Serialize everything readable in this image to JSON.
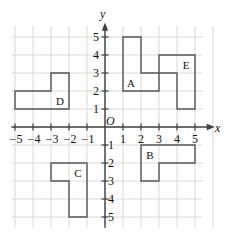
{
  "figure": {
    "type": "coordinate-plane-shapes",
    "background_color": "#ffffff",
    "grid_color": "#d9d9d9",
    "axis_color": "#404040",
    "shape_stroke_color": "#555555",
    "text_color": "#111111"
  },
  "geometry": {
    "origin_px": {
      "x": 105,
      "y": 127
    },
    "unit_px": 18,
    "grid_x_range": [
      -5.2,
      6.0
    ],
    "grid_y_range": [
      -5.6,
      5.6
    ]
  },
  "axes": {
    "x_axis": {
      "label": "x",
      "label_pos": {
        "x": 215,
        "y": 122
      },
      "ticks": [
        {
          "value": -5,
          "label": "−5"
        },
        {
          "value": -4,
          "label": "−4"
        },
        {
          "value": -3,
          "label": "−3"
        },
        {
          "value": -2,
          "label": "−2"
        },
        {
          "value": -1,
          "label": "−1"
        },
        {
          "value": 1,
          "label": "1"
        },
        {
          "value": 2,
          "label": "2"
        },
        {
          "value": 3,
          "label": "3"
        },
        {
          "value": 4,
          "label": "4"
        },
        {
          "value": 5,
          "label": "5"
        }
      ]
    },
    "y_axis": {
      "label": "y",
      "label_pos": {
        "x": 100,
        "y": 8
      },
      "ticks": [
        {
          "value": 5,
          "label": "5"
        },
        {
          "value": 4,
          "label": "4"
        },
        {
          "value": 3,
          "label": "3"
        },
        {
          "value": 2,
          "label": "2"
        },
        {
          "value": 1,
          "label": "1"
        },
        {
          "value": -1,
          "label": "−1"
        },
        {
          "value": -2,
          "label": "−2"
        },
        {
          "value": -3,
          "label": "−3"
        },
        {
          "value": -4,
          "label": "−4"
        },
        {
          "value": -5,
          "label": "−5"
        }
      ]
    },
    "origin": {
      "label": "O"
    }
  },
  "shapes": [
    {
      "id": "A",
      "label": "A",
      "label_point": {
        "x": 1.45,
        "y": 2.45
      },
      "points": [
        [
          1,
          2
        ],
        [
          1,
          5
        ],
        [
          2,
          5
        ],
        [
          2,
          3
        ],
        [
          3,
          3
        ],
        [
          3,
          2
        ]
      ]
    },
    {
      "id": "B",
      "label": "B",
      "label_point": {
        "x": 2.5,
        "y": -1.55
      },
      "points": [
        [
          2,
          -1
        ],
        [
          5,
          -1
        ],
        [
          5,
          -2
        ],
        [
          3,
          -2
        ],
        [
          3,
          -3
        ],
        [
          2,
          -3
        ]
      ]
    },
    {
      "id": "C",
      "label": "C",
      "label_point": {
        "x": -1.5,
        "y": -2.55
      },
      "points": [
        [
          -3,
          -2
        ],
        [
          -1,
          -2
        ],
        [
          -1,
          -5
        ],
        [
          -2,
          -5
        ],
        [
          -2,
          -3
        ],
        [
          -3,
          -3
        ]
      ]
    },
    {
      "id": "D",
      "label": "D",
      "label_point": {
        "x": -2.5,
        "y": 1.45
      },
      "points": [
        [
          -5,
          1
        ],
        [
          -2,
          1
        ],
        [
          -2,
          3
        ],
        [
          -3,
          3
        ],
        [
          -3,
          2
        ],
        [
          -5,
          2
        ]
      ]
    },
    {
      "id": "E",
      "label": "E",
      "label_point": {
        "x": 4.5,
        "y": 3.45
      },
      "points": [
        [
          3,
          3
        ],
        [
          3,
          4
        ],
        [
          5,
          4
        ],
        [
          5,
          1
        ],
        [
          4,
          1
        ],
        [
          4,
          3
        ]
      ]
    }
  ]
}
